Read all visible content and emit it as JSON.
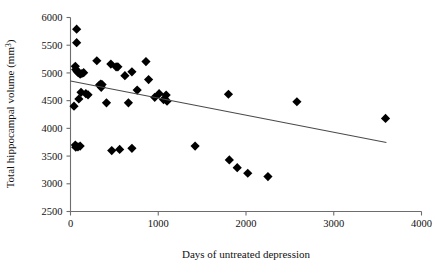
{
  "figure": {
    "background_color": "#ffffff",
    "point_color": "#000000",
    "axis_color": "#6d6d6d",
    "line_color": "#4a4a4a",
    "marker": "filled-diamond"
  },
  "axes": {
    "x_title": "Days of untreated  depression",
    "y_title_main": "Total hippocampal volume (mm",
    "y_title_sup": "3",
    "y_title_tail": ")",
    "x_ticks": [
      "0",
      "1000",
      "2000",
      "3000",
      "4000"
    ],
    "y_ticks": [
      "6000",
      "5500",
      "5000",
      "4500",
      "4000",
      "3500",
      "3000",
      "2500"
    ]
  },
  "chart_data": {
    "type": "scatter",
    "title": "",
    "xlabel": "Days of untreated  depression",
    "ylabel": "Total hippocampal volume (mm3)",
    "xlim": [
      0,
      4000
    ],
    "ylim": [
      2500,
      6000
    ],
    "xticks": [
      0,
      1000,
      2000,
      3000,
      4000
    ],
    "yticks": [
      2500,
      3000,
      3500,
      4000,
      4500,
      5000,
      5500,
      6000
    ],
    "grid": false,
    "legend": "none",
    "points": [
      [
        70,
        5790
      ],
      [
        70,
        5545
      ],
      [
        55,
        5120
      ],
      [
        60,
        5060
      ],
      [
        75,
        5030
      ],
      [
        85,
        5010
      ],
      [
        95,
        5005
      ],
      [
        110,
        4980
      ],
      [
        130,
        4990
      ],
      [
        150,
        5005
      ],
      [
        40,
        4400
      ],
      [
        55,
        3700
      ],
      [
        60,
        3660
      ],
      [
        85,
        3665
      ],
      [
        110,
        3680
      ],
      [
        95,
        4530
      ],
      [
        120,
        4650
      ],
      [
        175,
        4625
      ],
      [
        200,
        4605
      ],
      [
        330,
        4780
      ],
      [
        345,
        4800
      ],
      [
        350,
        4740
      ],
      [
        360,
        4790
      ],
      [
        300,
        5220
      ],
      [
        460,
        5160
      ],
      [
        520,
        5110
      ],
      [
        540,
        5110
      ],
      [
        410,
        4460
      ],
      [
        470,
        3600
      ],
      [
        560,
        3620
      ],
      [
        620,
        4950
      ],
      [
        660,
        4460
      ],
      [
        700,
        5020
      ],
      [
        700,
        3640
      ],
      [
        760,
        4690
      ],
      [
        860,
        5205
      ],
      [
        890,
        4880
      ],
      [
        960,
        4560
      ],
      [
        1010,
        4625
      ],
      [
        1060,
        4520
      ],
      [
        1090,
        4600
      ],
      [
        1100,
        4490
      ],
      [
        1420,
        3680
      ],
      [
        1800,
        4615
      ],
      [
        1810,
        3430
      ],
      [
        1900,
        3290
      ],
      [
        2020,
        3190
      ],
      [
        2250,
        3130
      ],
      [
        2580,
        4480
      ],
      [
        3590,
        4180
      ]
    ],
    "regression_line": {
      "x_start": 0,
      "y_start": 4855,
      "x_end": 3600,
      "y_end": 3745
    }
  }
}
